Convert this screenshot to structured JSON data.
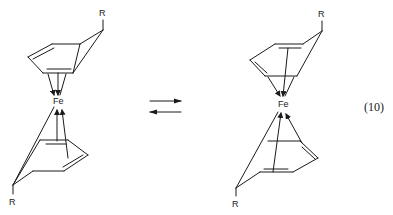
{
  "diagram": {
    "type": "chemical-equilibrium",
    "equation_number": "(10)",
    "equilibrium_arrow": "⇌",
    "left_structure": {
      "metal": "Fe",
      "substituent_top": "R",
      "substituent_bottom": "R"
    },
    "right_structure": {
      "metal": "Fe",
      "substituent_top": "R",
      "substituent_bottom": "R"
    }
  }
}
